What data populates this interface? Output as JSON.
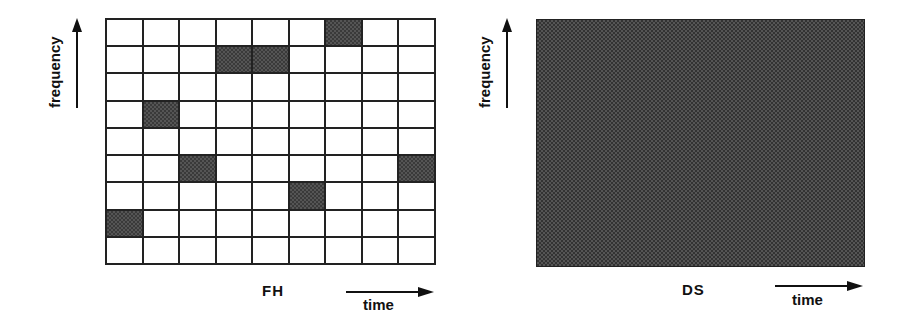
{
  "fh": {
    "title": "FH",
    "y_axis_label": "frequency",
    "x_axis_label": "time",
    "grid": {
      "rows": 9,
      "cols": 9,
      "filled_cells": [
        {
          "row": 0,
          "col": 6
        },
        {
          "row": 1,
          "col": 3
        },
        {
          "row": 1,
          "col": 4
        },
        {
          "row": 3,
          "col": 1
        },
        {
          "row": 5,
          "col": 2
        },
        {
          "row": 5,
          "col": 8
        },
        {
          "row": 6,
          "col": 5
        },
        {
          "row": 7,
          "col": 0
        }
      ]
    }
  },
  "ds": {
    "title": "DS",
    "y_axis_label": "frequency",
    "x_axis_label": "time",
    "fill": "entire time-frequency area shaded"
  },
  "colors": {
    "grid_line": "#222222",
    "shaded": "#3a3a3a",
    "background": "#ffffff"
  }
}
